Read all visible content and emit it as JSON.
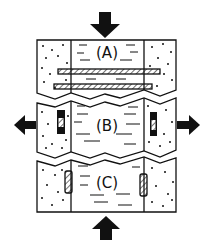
{
  "diagram": {
    "panels": [
      {
        "id": "A",
        "label": "(A)",
        "description": "compression, horizontal fractures"
      },
      {
        "id": "B",
        "label": "(B)",
        "description": "extension, opened vertical fractures"
      },
      {
        "id": "C",
        "label": "(C)",
        "description": "compression, closed vertical fractures"
      }
    ],
    "arrows": [
      {
        "position": "top",
        "direction": "down"
      },
      {
        "position": "left",
        "direction": "left"
      },
      {
        "position": "right",
        "direction": "right"
      },
      {
        "position": "bottom",
        "direction": "up"
      }
    ],
    "colors": {
      "ink": "#111111",
      "background": "#ffffff"
    }
  }
}
